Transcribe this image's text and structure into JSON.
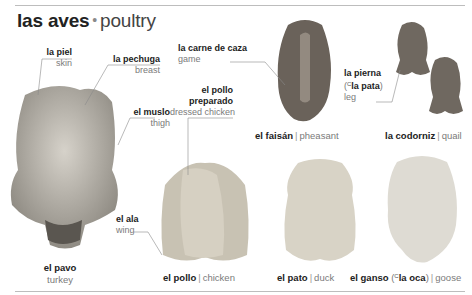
{
  "header": {
    "title_es": "las aves",
    "title_sep": "•",
    "title_en": "poultry"
  },
  "parts": [
    {
      "es": "la piel",
      "en": "skin"
    },
    {
      "es": "la pechuga",
      "en": "breast"
    },
    {
      "es": "el muslo",
      "en": "thigh"
    },
    {
      "es": "el ala",
      "en": "wing"
    },
    {
      "es": "la carne de caza",
      "en": "game"
    },
    {
      "es": "el pollo preparado",
      "es_line1": "el pollo",
      "es_line2": "preparado",
      "en": "dressed chicken"
    },
    {
      "es": "la pierna",
      "alt_prefix": "(",
      "alt_sup": "C",
      "alt": "la pata",
      "alt_suffix": ")",
      "en": "leg"
    }
  ],
  "birds": [
    {
      "es": "el pavo",
      "en": "turkey",
      "color": "#b8b4ab"
    },
    {
      "es": "el pollo",
      "en": "chicken",
      "color": "#c8c2b3"
    },
    {
      "es": "el pato",
      "en": "duck",
      "color": "#d8d3c6"
    },
    {
      "es": "el ganso",
      "alt_prefix": "(",
      "alt_sup": "C",
      "alt": "la oca",
      "alt_suffix": ")",
      "en": "goose",
      "color": "#dedbd3"
    },
    {
      "es": "el faisán",
      "en": "pheasant",
      "color": "#6a625a"
    },
    {
      "es": "la codorniz",
      "en": "quail",
      "color": "#6f6860"
    }
  ],
  "separator": "|"
}
